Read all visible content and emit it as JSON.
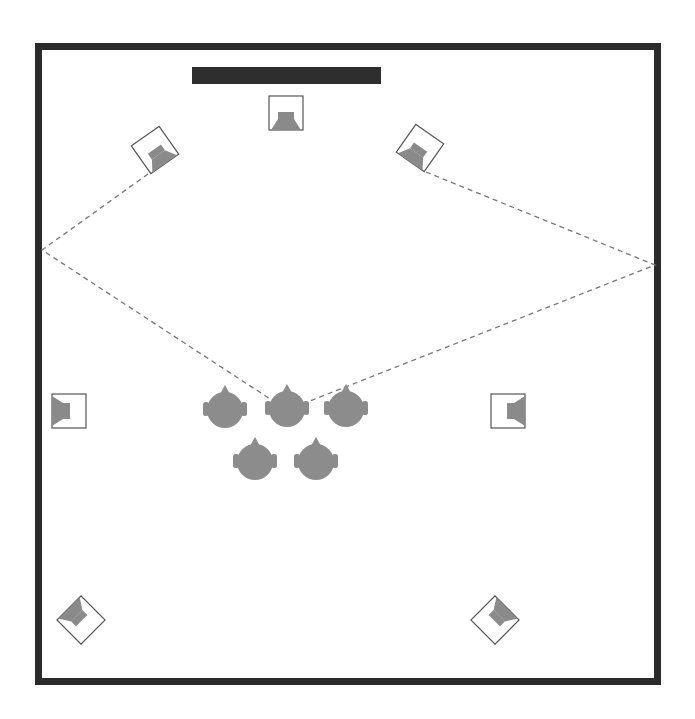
{
  "diagram": {
    "type": "surround-sound-room-layout",
    "colors": {
      "wall": "#2b2b2b",
      "screen": "#2e2e2e",
      "speaker_box_stroke": "#555555",
      "speaker_fill": "#8a8a8a",
      "listener_fill": "#8c8c8c",
      "reflection_line": "#777777"
    },
    "room": {
      "x": 35,
      "y": 43,
      "width": 626,
      "height": 642,
      "wall_thickness": 7
    },
    "screen": {
      "x": 192,
      "y": 67,
      "width": 189,
      "height": 17
    },
    "speakers": [
      {
        "id": "center",
        "cx": 286,
        "cy": 113,
        "rotation": 0
      },
      {
        "id": "front-left",
        "cx": 155,
        "cy": 150,
        "rotation": -35
      },
      {
        "id": "front-right",
        "cx": 420,
        "cy": 148,
        "rotation": 35
      },
      {
        "id": "side-left",
        "cx": 69,
        "cy": 411,
        "rotation": 90
      },
      {
        "id": "side-right",
        "cx": 508,
        "cy": 411,
        "rotation": -90
      },
      {
        "id": "rear-left",
        "cx": 81,
        "cy": 620,
        "rotation": 135
      },
      {
        "id": "rear-right",
        "cx": 495,
        "cy": 620,
        "rotation": -135
      }
    ],
    "listeners": [
      {
        "cx": 225,
        "cy": 410
      },
      {
        "cx": 287,
        "cy": 409
      },
      {
        "cx": 346,
        "cy": 409
      },
      {
        "cx": 255,
        "cy": 462
      },
      {
        "cx": 316,
        "cy": 462
      }
    ],
    "reflection_paths": [
      {
        "points": [
          [
            148,
            174
          ],
          [
            42,
            250
          ],
          [
            287,
            410
          ]
        ]
      },
      {
        "points": [
          [
            426,
            172
          ],
          [
            655,
            265
          ],
          [
            287,
            410
          ]
        ]
      }
    ]
  }
}
